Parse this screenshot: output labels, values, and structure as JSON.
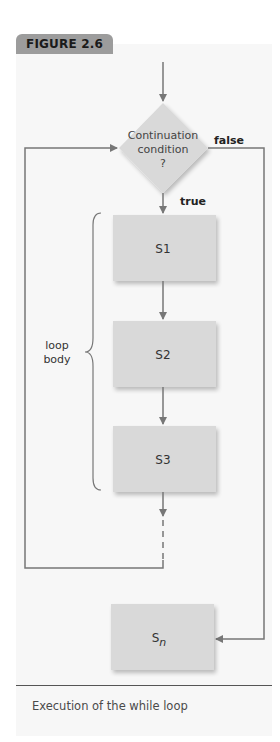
{
  "figure": {
    "tag": "FIGURE 2.6",
    "caption": "Execution of the while loop"
  },
  "diagram": {
    "condition": {
      "line1": "Continuation",
      "line2": "condition",
      "line3": "?"
    },
    "edges": {
      "false_label": "false",
      "true_label": "true"
    },
    "statements": [
      {
        "label": "S1"
      },
      {
        "label": "S2"
      },
      {
        "label": "S3"
      }
    ],
    "final_statement": {
      "base": "S",
      "subscript": "n"
    },
    "brace": {
      "line1": "loop",
      "line2": "body"
    },
    "colors": {
      "box_fill": "#d9d9d9",
      "line": "#777777",
      "panel": "#f7f7f7",
      "tag": "#9c9c9c"
    }
  }
}
